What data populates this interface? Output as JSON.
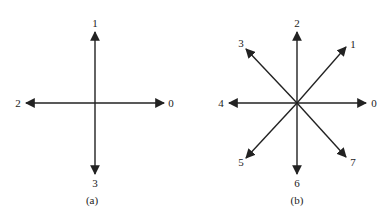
{
  "figure_a": {
    "caption": "(a)",
    "labels": {
      "right": "0",
      "up": "1",
      "left": "2",
      "down": "3"
    }
  },
  "figure_b": {
    "caption": "(b)",
    "labels": {
      "e": "0",
      "ne": "1",
      "n": "2",
      "nw": "3",
      "w": "4",
      "sw": "5",
      "s": "6",
      "se": "7"
    }
  },
  "colors": {
    "stroke": "#222222",
    "background": "#ffffff"
  }
}
